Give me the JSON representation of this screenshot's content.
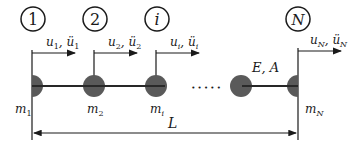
{
  "diagram": {
    "type": "lumped-mass-bar",
    "nodes": [
      {
        "label": "1",
        "x": 32,
        "disp_label_u": "u",
        "disp_sub": "1",
        "disp_label_a": "ü",
        "mass_label": "m",
        "mass_sub": "1"
      },
      {
        "label": "2",
        "x": 94,
        "disp_label_u": "u",
        "disp_sub": "2",
        "disp_label_a": "ü",
        "mass_label": "m",
        "mass_sub": "2"
      },
      {
        "label": "i",
        "x": 156,
        "disp_label_u": "u",
        "disp_sub": "i",
        "disp_label_a": "ü",
        "mass_label": "m",
        "mass_sub": "i"
      },
      {
        "label": "N",
        "x": 298,
        "disp_label_u": "u",
        "disp_sub": "N",
        "disp_label_a": "ü",
        "mass_label": "m",
        "mass_sub": "N"
      }
    ],
    "ellipsis": "• • • • •",
    "material_label": "E, A",
    "length_label": "L",
    "colors": {
      "mass_fill": "#5a5a5a",
      "line": "#1a1a1a",
      "background": "#ffffff"
    }
  }
}
